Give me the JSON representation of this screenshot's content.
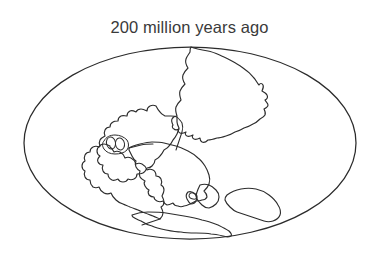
{
  "figure": {
    "title": "200 million years ago",
    "caption_position": "top-center",
    "background_color": "#ffffff",
    "line_color": "#2d2d2d",
    "title_color": "#3a3a3a"
  },
  "map": {
    "projection": "oval",
    "globe": {
      "center_x": 190,
      "center_y": 143,
      "radius_x": 166,
      "radius_y": 96,
      "stroke_color": "#2b2b2b"
    },
    "landmasses": [
      {
        "id": "laurentia",
        "label": "North America",
        "region": "northwest"
      },
      {
        "id": "eurasia",
        "label": "Eurasia",
        "region": "northeast"
      },
      {
        "id": "south-america",
        "label": "South America",
        "region": "southwest"
      },
      {
        "id": "africa",
        "label": "Africa",
        "region": "south-central"
      },
      {
        "id": "india",
        "label": "India",
        "region": "south-central-east"
      },
      {
        "id": "australia",
        "label": "Australia",
        "region": "southeast"
      },
      {
        "id": "antarctica",
        "label": "Antarctica",
        "region": "far-south"
      },
      {
        "id": "islets",
        "label": "Island fragments",
        "region": "central-west"
      }
    ]
  }
}
